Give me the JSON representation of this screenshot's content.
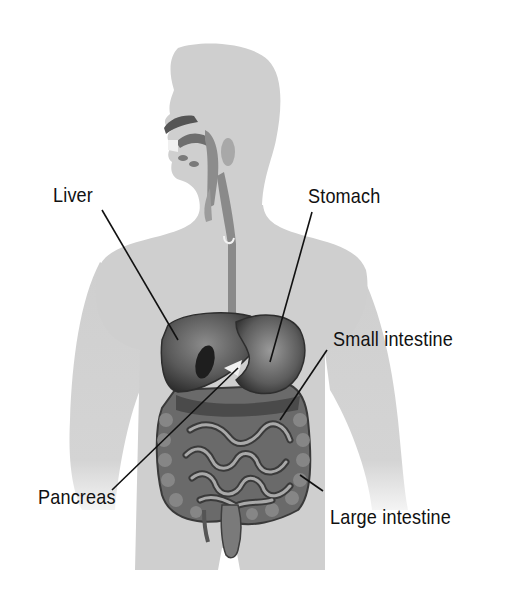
{
  "diagram": {
    "colors": {
      "body": "#cfcfcf",
      "body_shade": "#c4c4c4",
      "organ_dark": "#3a3a3a",
      "organ_mid": "#6a6a6a",
      "organ_light": "#9a9a9a",
      "leader_line": "#111111",
      "text": "#111111"
    },
    "labels": [
      {
        "id": "liver",
        "text": "Liver",
        "x": 53,
        "y": 184,
        "line": [
          102,
          210,
          178,
          332
        ]
      },
      {
        "id": "stomach",
        "text": "Stomach",
        "x": 308,
        "y": 185,
        "line": [
          312,
          212,
          270,
          360
        ]
      },
      {
        "id": "small-intestine",
        "text": "Small intestine",
        "x": 333,
        "y": 328,
        "line": [
          327,
          350,
          280,
          418
        ]
      },
      {
        "id": "pancreas",
        "text": "Pancreas",
        "x": 38,
        "y": 486,
        "line": [
          112,
          490,
          238,
          368
        ]
      },
      {
        "id": "large-intestine",
        "text": "Large intestine",
        "x": 330,
        "y": 506,
        "line": [
          322,
          490,
          300,
          474
        ]
      }
    ]
  }
}
